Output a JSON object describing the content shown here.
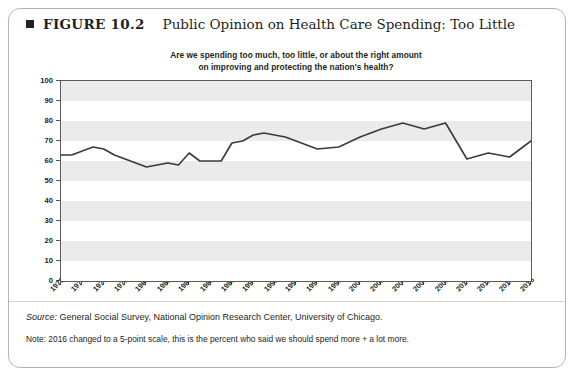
{
  "figure": {
    "bullet": "square-bullet",
    "number": "FIGURE 10.2",
    "title": "Public Opinion on Health Care Spending: Too Little"
  },
  "chart_title_line1": "Are we spending too much, too little, or about the right amount",
  "chart_title_line2": "on improving and protecting the nation's health?",
  "footer": {
    "source": "Source: General Social Survey, National Opinion Research Center, University of Chicago.",
    "note": "Note: 2016 changed to a 5-point scale, this is the percent who said we should spend more + a lot more."
  },
  "chart_data": {
    "type": "line",
    "title": "Are we spending too much, too little, or about the right amount on improving and protecting the nation's health?",
    "xlabel": "",
    "ylabel": "Percent saying \"too little\"",
    "ylim": [
      0,
      100
    ],
    "ytick_step": 10,
    "yticks": [
      0,
      10,
      20,
      30,
      40,
      50,
      60,
      70,
      80,
      90,
      100
    ],
    "xlim": [
      1972,
      2016
    ],
    "xticks": [
      1972,
      1974,
      1976,
      1978,
      1980,
      1982,
      1984,
      1986,
      1988,
      1990,
      1992,
      1994,
      1996,
      1998,
      2000,
      2002,
      2004,
      2006,
      2008,
      2010,
      2012,
      2014,
      2016
    ],
    "grid": "horizontal-bands",
    "legend": "none",
    "line_color": "#3a3a3a",
    "series": [
      {
        "name": "Percent saying too little",
        "x": [
          1972,
          1973,
          1974,
          1975,
          1976,
          1977,
          1978,
          1980,
          1982,
          1983,
          1984,
          1985,
          1986,
          1987,
          1988,
          1989,
          1990,
          1991,
          1993,
          1994,
          1996,
          1998,
          2000,
          2002,
          2004,
          2006,
          2008,
          2010,
          2012,
          2014,
          2016
        ],
        "values": [
          63,
          63,
          65,
          67,
          66,
          63,
          61,
          57,
          59,
          58,
          64,
          60,
          60,
          60,
          69,
          70,
          73,
          74,
          72,
          70,
          66,
          67,
          72,
          76,
          79,
          76,
          79,
          61,
          64,
          62,
          70
        ]
      }
    ]
  }
}
